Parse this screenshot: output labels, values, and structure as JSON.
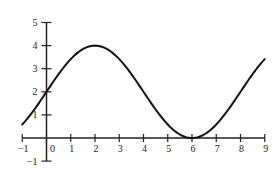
{
  "chart_data": {
    "type": "line",
    "title": "",
    "xlabel": "",
    "ylabel": "",
    "function": "y = 2 + 2 sin(pi x / 4)",
    "xlim": [
      -1,
      9
    ],
    "ylim": [
      -1,
      5
    ],
    "grid": false,
    "legend": null,
    "x_ticks": [
      -1,
      0,
      1,
      2,
      3,
      4,
      5,
      6,
      7,
      8,
      9
    ],
    "x_tick_labels": [
      "−1",
      "0",
      "1",
      "2",
      "3",
      "4",
      "5",
      "6",
      "7",
      "8",
      "9"
    ],
    "y_ticks": [
      -1,
      1,
      2,
      3,
      4,
      5
    ],
    "y_tick_labels": [
      "−1",
      "1",
      "2",
      "3",
      "4",
      "5"
    ],
    "series": [
      {
        "name": "curve",
        "x": [
          -1,
          0,
          1,
          2,
          3,
          4,
          5,
          6,
          7,
          8,
          9
        ],
        "y": [
          0.59,
          2,
          3.41,
          4,
          3.41,
          2,
          0.59,
          0,
          0.59,
          2,
          3.41
        ]
      }
    ],
    "annotations": {
      "maximum": {
        "x": 2,
        "y": 4
      },
      "minimum": {
        "x": 6,
        "y": 0
      }
    },
    "colors": {
      "curve": "#111111",
      "axes": "#222222"
    }
  }
}
